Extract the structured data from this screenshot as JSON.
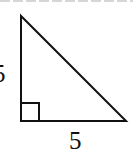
{
  "diagram": {
    "type": "right-triangle",
    "shape": "right isosceles triangle",
    "stroke_color": "#111111",
    "background": "#ffffff",
    "vertices": {
      "top": [
        21,
        16
      ],
      "right_angle": [
        21,
        121
      ],
      "right": [
        126,
        121
      ]
    },
    "right_angle_marker": true,
    "labels": {
      "vertical_leg": "5",
      "horizontal_leg": "5"
    },
    "cropped_top_text": true
  }
}
